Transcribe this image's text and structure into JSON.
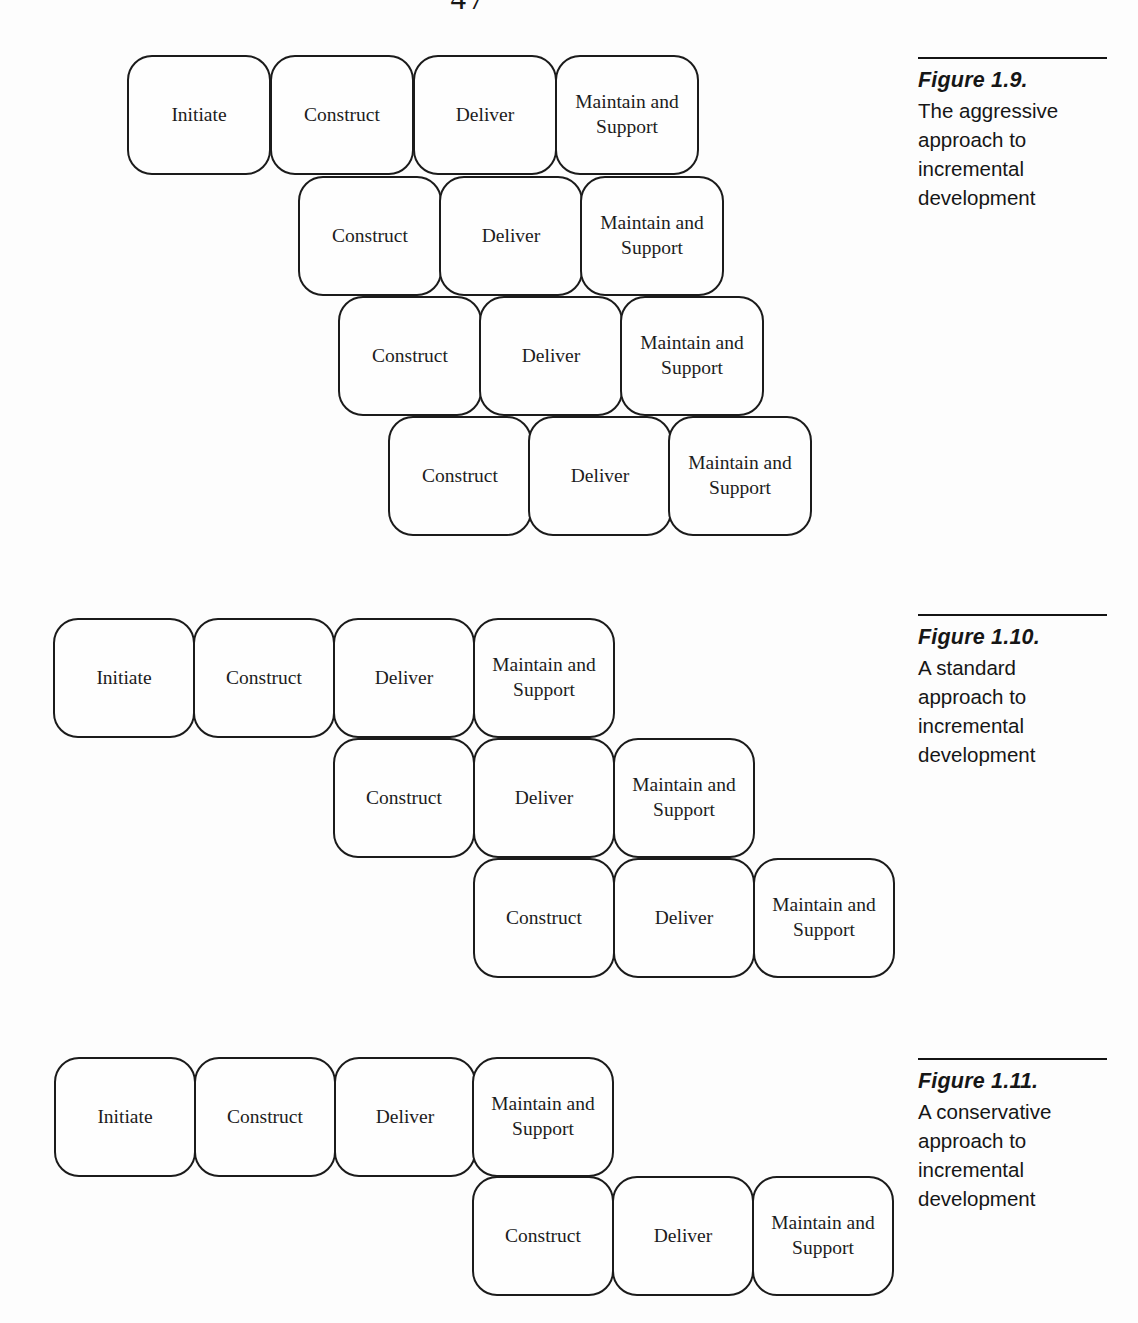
{
  "page": {
    "number": "47",
    "paper_color": "#fdfdfd",
    "ink_color": "#1b1b1b"
  },
  "figures": [
    {
      "name": "figure-1-9",
      "caption": {
        "title": "Figure 1.9.",
        "lines": [
          "The aggressive",
          "approach to",
          "incremental",
          "development"
        ],
        "x": 918,
        "y": 57
      },
      "box_size": {
        "w": 144,
        "h": 120
      },
      "boxes": [
        {
          "label": "Initiate",
          "x": 127,
          "y": 55
        },
        {
          "label": "Construct",
          "x": 270,
          "y": 55
        },
        {
          "label": "Deliver",
          "x": 413,
          "y": 55
        },
        {
          "label": "Maintain and Support",
          "x": 555,
          "y": 55
        },
        {
          "label": "Construct",
          "x": 298,
          "y": 176
        },
        {
          "label": "Deliver",
          "x": 439,
          "y": 176
        },
        {
          "label": "Maintain and Support",
          "x": 580,
          "y": 176
        },
        {
          "label": "Construct",
          "x": 338,
          "y": 296
        },
        {
          "label": "Deliver",
          "x": 479,
          "y": 296
        },
        {
          "label": "Maintain and Support",
          "x": 620,
          "y": 296
        },
        {
          "label": "Construct",
          "x": 388,
          "y": 416
        },
        {
          "label": "Deliver",
          "x": 528,
          "y": 416
        },
        {
          "label": "Maintain and Support",
          "x": 668,
          "y": 416
        }
      ]
    },
    {
      "name": "figure-1-10",
      "caption": {
        "title": "Figure 1.10.",
        "lines": [
          "A standard",
          "approach to",
          "incremental",
          "development"
        ],
        "x": 918,
        "y": 614
      },
      "box_size": {
        "w": 142,
        "h": 120
      },
      "boxes": [
        {
          "label": "Initiate",
          "x": 53,
          "y": 618
        },
        {
          "label": "Construct",
          "x": 193,
          "y": 618
        },
        {
          "label": "Deliver",
          "x": 333,
          "y": 618
        },
        {
          "label": "Maintain and Support",
          "x": 473,
          "y": 618
        },
        {
          "label": "Construct",
          "x": 333,
          "y": 738
        },
        {
          "label": "Deliver",
          "x": 473,
          "y": 738
        },
        {
          "label": "Maintain and Support",
          "x": 613,
          "y": 738
        },
        {
          "label": "Construct",
          "x": 473,
          "y": 858
        },
        {
          "label": "Deliver",
          "x": 613,
          "y": 858
        },
        {
          "label": "Maintain and Support",
          "x": 753,
          "y": 858
        }
      ]
    },
    {
      "name": "figure-1-11",
      "caption": {
        "title": "Figure 1.11.",
        "lines": [
          "A conservative",
          "approach to",
          "incremental",
          "development"
        ],
        "x": 918,
        "y": 1058
      },
      "box_size": {
        "w": 142,
        "h": 120
      },
      "boxes": [
        {
          "label": "Initiate",
          "x": 54,
          "y": 1057
        },
        {
          "label": "Construct",
          "x": 194,
          "y": 1057
        },
        {
          "label": "Deliver",
          "x": 334,
          "y": 1057
        },
        {
          "label": "Maintain and Support",
          "x": 472,
          "y": 1057
        },
        {
          "label": "Construct",
          "x": 472,
          "y": 1176
        },
        {
          "label": "Deliver",
          "x": 612,
          "y": 1176
        },
        {
          "label": "Maintain and Support",
          "x": 752,
          "y": 1176
        }
      ]
    }
  ]
}
